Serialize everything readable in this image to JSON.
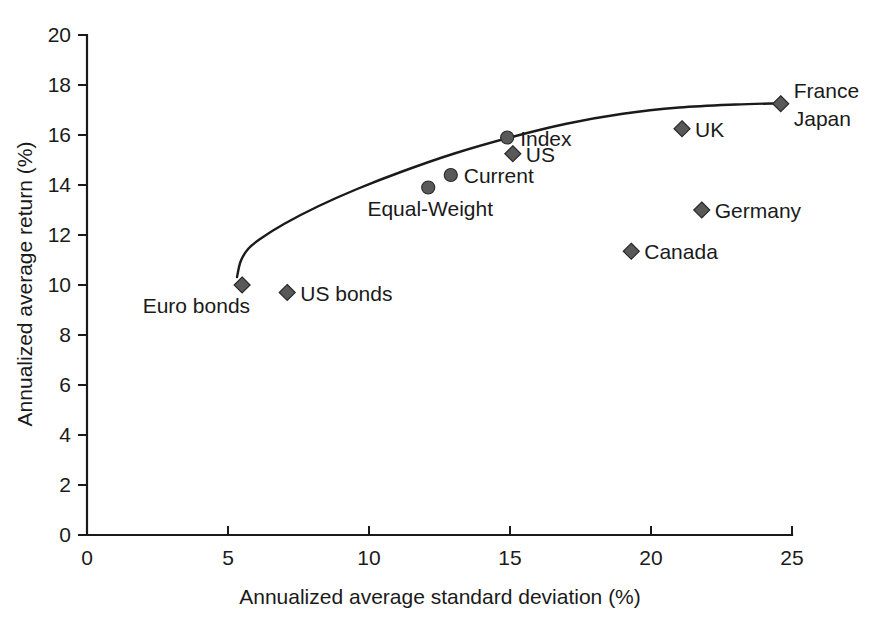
{
  "chart_data": {
    "type": "scatter",
    "title": "",
    "xlabel": "Annualized average standard deviation (%)",
    "ylabel": "Annualized average return (%)",
    "xlim": [
      0,
      25
    ],
    "ylim": [
      0,
      20
    ],
    "xticks": [
      "0",
      "5",
      "10",
      "15",
      "20",
      "25"
    ],
    "yticks": [
      "0",
      "2",
      "4",
      "6",
      "8",
      "10",
      "12",
      "14",
      "16",
      "18",
      "20"
    ],
    "grid": false,
    "legend": "none",
    "marker_color": "#595959",
    "line_color": "#1a1a1a",
    "points": [
      {
        "label": "Euro bonds",
        "x": 5.5,
        "y": 10.0,
        "marker": "diamond",
        "label_pos": "below-left"
      },
      {
        "label": "US bonds",
        "x": 7.1,
        "y": 9.7,
        "marker": "diamond",
        "label_pos": "right"
      },
      {
        "label": "Equal-Weight",
        "x": 12.1,
        "y": 13.9,
        "marker": "circle",
        "label_pos": "below"
      },
      {
        "label": "Current",
        "x": 12.9,
        "y": 14.4,
        "marker": "circle",
        "label_pos": "right"
      },
      {
        "label": "Index",
        "x": 14.9,
        "y": 15.9,
        "marker": "circle",
        "label_pos": "right"
      },
      {
        "label": "US",
        "x": 15.1,
        "y": 15.25,
        "marker": "diamond",
        "label_pos": "right"
      },
      {
        "label": "Canada",
        "x": 19.3,
        "y": 11.35,
        "marker": "diamond",
        "label_pos": "right"
      },
      {
        "label": "UK",
        "x": 21.1,
        "y": 16.25,
        "marker": "diamond",
        "label_pos": "right"
      },
      {
        "label": "Germany",
        "x": 21.8,
        "y": 13.0,
        "marker": "diamond",
        "label_pos": "right"
      },
      {
        "label": "France",
        "x": 24.6,
        "y": 17.25,
        "marker": "diamond",
        "label_pos": "right-upper"
      },
      {
        "label": "Japan",
        "x": 24.6,
        "y": 17.25,
        "marker": "none",
        "label_pos": "right-lower"
      }
    ],
    "curve": {
      "name": "efficient-frontier",
      "points": [
        {
          "x": 5.32,
          "y": 10.32
        },
        {
          "x": 5.45,
          "y": 10.95
        },
        {
          "x": 5.72,
          "y": 11.45
        },
        {
          "x": 6.15,
          "y": 11.85
        },
        {
          "x": 7.0,
          "y": 12.45
        },
        {
          "x": 8.2,
          "y": 13.15
        },
        {
          "x": 9.6,
          "y": 13.85
        },
        {
          "x": 11.2,
          "y": 14.55
        },
        {
          "x": 13.0,
          "y": 15.25
        },
        {
          "x": 15.0,
          "y": 15.9
        },
        {
          "x": 17.0,
          "y": 16.45
        },
        {
          "x": 19.0,
          "y": 16.85
        },
        {
          "x": 21.0,
          "y": 17.1
        },
        {
          "x": 23.0,
          "y": 17.22
        },
        {
          "x": 24.6,
          "y": 17.27
        }
      ]
    }
  }
}
